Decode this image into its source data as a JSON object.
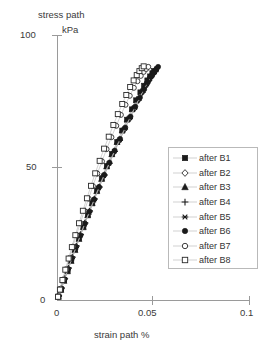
{
  "chart_data": {
    "type": "scatter",
    "title": "stress path",
    "title_unit": "kPa",
    "xlabel": "strain path %",
    "ylabel": "",
    "xlim": [
      0,
      0.1
    ],
    "ylim": [
      0,
      100
    ],
    "xticks": [
      "0",
      "0.05",
      "0.1"
    ],
    "xtick_values": [
      0,
      0.05,
      0.1
    ],
    "yticks": [
      "0",
      "50",
      "100"
    ],
    "ytick_values": [
      0,
      50,
      100
    ],
    "grid": false,
    "legend_position": "center-right",
    "markers_connected_by_lines": true,
    "series": [
      {
        "name": "after B1",
        "marker": "filled-square",
        "x": [
          0.0008,
          0.0021,
          0.0037,
          0.0055,
          0.0074,
          0.0094,
          0.0115,
          0.0137,
          0.016,
          0.0183,
          0.0207,
          0.0232,
          0.0258,
          0.0285,
          0.0312,
          0.0338,
          0.0363,
          0.0388,
          0.041,
          0.0432,
          0.0451,
          0.0468,
          0.0482,
          0.0494,
          0.0503
        ],
        "y": [
          1.5,
          4.2,
          7.6,
          11.3,
          15.2,
          19.3,
          23.5,
          27.9,
          32.3,
          36.8,
          41.4,
          46.0,
          50.6,
          55.2,
          59.7,
          64.0,
          68.1,
          72.0,
          75.4,
          78.4,
          80.9,
          82.9,
          84.4,
          85.6,
          86.4
        ]
      },
      {
        "name": "after B2",
        "marker": "open-diamond",
        "x": [
          0.0009,
          0.0023,
          0.004,
          0.0059,
          0.0079,
          0.01,
          0.0122,
          0.0145,
          0.0169,
          0.0193,
          0.0218,
          0.0244,
          0.027,
          0.0296,
          0.0323,
          0.0349,
          0.0374,
          0.0398,
          0.042,
          0.044,
          0.0458,
          0.0474,
          0.0487,
          0.0498,
          0.0507
        ],
        "y": [
          1.7,
          4.6,
          8.2,
          12.1,
          16.2,
          20.4,
          24.7,
          29.1,
          33.6,
          38.1,
          42.6,
          47.1,
          51.6,
          56.0,
          60.3,
          64.5,
          68.4,
          72.1,
          75.4,
          78.3,
          80.8,
          82.8,
          84.3,
          85.5,
          86.3
        ]
      },
      {
        "name": "after B3",
        "marker": "filled-triangle",
        "x": [
          0.0007,
          0.002,
          0.0036,
          0.0054,
          0.0073,
          0.0093,
          0.0114,
          0.0136,
          0.0159,
          0.0182,
          0.0206,
          0.0231,
          0.0257,
          0.0284,
          0.0311,
          0.0338,
          0.0364,
          0.039,
          0.0414,
          0.0436,
          0.0456,
          0.0473,
          0.0488,
          0.05,
          0.051
        ],
        "y": [
          1.4,
          4.0,
          7.4,
          11.0,
          14.9,
          19.0,
          23.2,
          27.6,
          32.1,
          36.6,
          41.2,
          45.8,
          50.5,
          55.1,
          59.7,
          64.1,
          68.3,
          72.2,
          75.7,
          78.7,
          81.3,
          83.4,
          85.0,
          86.2,
          87.0
        ]
      },
      {
        "name": "after B4",
        "marker": "plus",
        "x": [
          0.001,
          0.0024,
          0.0041,
          0.006,
          0.008,
          0.0101,
          0.0123,
          0.0146,
          0.017,
          0.0195,
          0.022,
          0.0246,
          0.0272,
          0.0299,
          0.0326,
          0.0352,
          0.0377,
          0.0401,
          0.0423,
          0.0443,
          0.0461,
          0.0477,
          0.049,
          0.0501,
          0.0512
        ],
        "y": [
          1.8,
          4.8,
          8.4,
          12.3,
          16.4,
          20.6,
          24.9,
          29.3,
          33.8,
          38.3,
          42.8,
          47.3,
          51.7,
          56.1,
          60.4,
          64.6,
          68.5,
          72.2,
          75.5,
          78.5,
          81.0,
          83.0,
          84.6,
          85.8,
          86.7
        ]
      },
      {
        "name": "after B5",
        "marker": "star",
        "x": [
          0.0008,
          0.0022,
          0.0038,
          0.0057,
          0.0077,
          0.0098,
          0.012,
          0.0143,
          0.0167,
          0.0191,
          0.0216,
          0.0242,
          0.0269,
          0.0296,
          0.0324,
          0.0351,
          0.0377,
          0.0402,
          0.0425,
          0.0446,
          0.0465,
          0.0481,
          0.0495,
          0.0506,
          0.0516
        ],
        "y": [
          1.6,
          4.4,
          7.9,
          11.7,
          15.8,
          20.0,
          24.3,
          28.7,
          33.2,
          37.8,
          42.4,
          47.0,
          51.6,
          56.1,
          60.5,
          64.8,
          68.8,
          72.6,
          76.0,
          79.0,
          81.6,
          83.6,
          85.2,
          86.4,
          87.3
        ]
      },
      {
        "name": "after B6",
        "marker": "filled-circle",
        "x": [
          0.0009,
          0.0023,
          0.0039,
          0.0058,
          0.0078,
          0.0099,
          0.0121,
          0.0144,
          0.0168,
          0.0193,
          0.0218,
          0.0245,
          0.0272,
          0.0299,
          0.0327,
          0.0354,
          0.0381,
          0.0406,
          0.043,
          0.0452,
          0.0471,
          0.0488,
          0.0502,
          0.0514,
          0.0524
        ],
        "y": [
          1.7,
          4.5,
          8.0,
          11.9,
          16.0,
          20.2,
          24.5,
          29.0,
          33.5,
          38.1,
          42.8,
          47.4,
          52.0,
          56.5,
          60.9,
          65.2,
          69.3,
          73.1,
          76.5,
          79.6,
          82.2,
          84.3,
          85.9,
          87.1,
          88.0
        ]
      },
      {
        "name": "after B7",
        "marker": "open-circle",
        "x": [
          0.0006,
          0.0017,
          0.0031,
          0.0047,
          0.0064,
          0.0082,
          0.0101,
          0.0121,
          0.0142,
          0.0164,
          0.0186,
          0.0209,
          0.0233,
          0.0257,
          0.0282,
          0.0307,
          0.0331,
          0.0355,
          0.0377,
          0.0398,
          0.0417,
          0.0434,
          0.0449,
          0.0462,
          0.0473
        ],
        "y": [
          1.5,
          4.3,
          7.9,
          11.8,
          16.0,
          20.3,
          24.7,
          29.2,
          33.8,
          38.4,
          43.1,
          47.8,
          52.4,
          57.0,
          61.5,
          65.8,
          69.9,
          73.7,
          77.1,
          80.1,
          82.6,
          84.6,
          86.1,
          87.2,
          88.0
        ]
      },
      {
        "name": "after B8",
        "marker": "open-square",
        "x": [
          0.0005,
          0.0015,
          0.0028,
          0.0043,
          0.006,
          0.0077,
          0.0095,
          0.0114,
          0.0134,
          0.0155,
          0.0176,
          0.0198,
          0.0221,
          0.0244,
          0.0268,
          0.0292,
          0.0315,
          0.0338,
          0.0359,
          0.0379,
          0.0397,
          0.0413,
          0.0427,
          0.0439,
          0.0449
        ],
        "y": [
          1.4,
          4.1,
          7.7,
          11.6,
          15.8,
          20.1,
          24.6,
          29.1,
          33.8,
          38.5,
          43.2,
          47.9,
          52.6,
          57.2,
          61.7,
          66.1,
          70.2,
          74.0,
          77.4,
          80.4,
          82.9,
          84.9,
          86.4,
          87.5,
          88.2
        ]
      }
    ]
  },
  "legend": {
    "items": [
      {
        "label": "after B1",
        "marker": "filled-square"
      },
      {
        "label": "after B2",
        "marker": "open-diamond"
      },
      {
        "label": "after B3",
        "marker": "filled-triangle"
      },
      {
        "label": "after B4",
        "marker": "plus"
      },
      {
        "label": "after B5",
        "marker": "star"
      },
      {
        "label": "after B6",
        "marker": "filled-circle"
      },
      {
        "label": "after B7",
        "marker": "open-circle"
      },
      {
        "label": "after B8",
        "marker": "open-square"
      }
    ]
  }
}
